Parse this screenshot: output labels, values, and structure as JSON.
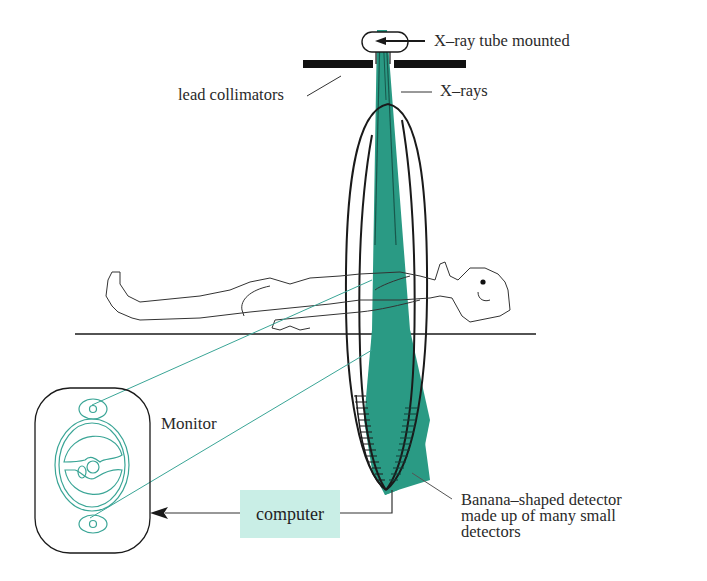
{
  "diagram": {
    "colors": {
      "beam": "#2a9a84",
      "outline": "#1a1a1a",
      "monitor_image": "#3aa596",
      "computer_box": "#c9eee6",
      "label_text": "#2a2a2a"
    },
    "labels": {
      "xray_tube": "X–ray tube mounted",
      "collimators": "lead collimators",
      "xrays": "X–rays",
      "monitor": "Monitor",
      "computer": "computer",
      "detector_line1": "Banana–shaped detector",
      "detector_line2": "made up of many small",
      "detector_line3": "detectors"
    },
    "components": [
      {
        "id": "xray-tube",
        "label": "X–ray tube mounted"
      },
      {
        "id": "lead-collimators",
        "label": "lead collimators"
      },
      {
        "id": "xray-beam",
        "label": "X–rays"
      },
      {
        "id": "gantry-ring"
      },
      {
        "id": "patient"
      },
      {
        "id": "table"
      },
      {
        "id": "detector-array",
        "label": "Banana–shaped detector made up of many small detectors"
      },
      {
        "id": "computer",
        "label": "computer"
      },
      {
        "id": "monitor",
        "label": "Monitor"
      }
    ],
    "connections": [
      {
        "from": "detector-array",
        "to": "computer"
      },
      {
        "from": "computer",
        "to": "monitor"
      }
    ]
  }
}
